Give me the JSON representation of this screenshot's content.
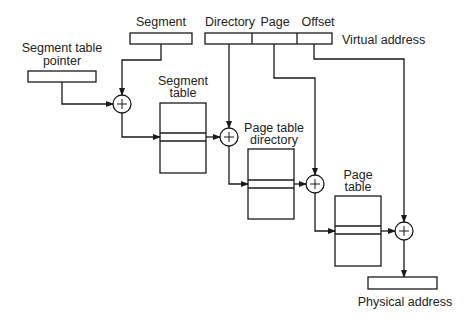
{
  "diagram": {
    "labels": {
      "segment": "Segment",
      "directory": "Directory",
      "page": "Page",
      "offset": "Offset",
      "virtual_address": "Virtual address",
      "segment_table_pointer_line1": "Segment table",
      "segment_table_pointer_line2": "pointer",
      "segment_table_line1": "Segment",
      "segment_table_line2": "table",
      "page_table_directory_line1": "Page table",
      "page_table_directory_line2": "directory",
      "page_table_line1": "Page",
      "page_table_line2": "table",
      "physical_address": "Physical address"
    },
    "adder_symbol": "+",
    "colors": {
      "stroke": "#1a1a1a",
      "background": "#ffffff",
      "text": "#222222"
    }
  }
}
